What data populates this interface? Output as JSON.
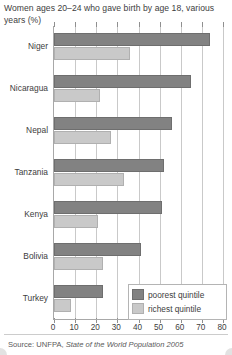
{
  "chart_data": {
    "type": "bar",
    "orientation": "horizontal",
    "title": "Women ages 20–24 who gave birth by age 18, various years (%)",
    "xlabel": "",
    "ylabel": "",
    "xlim": [
      0,
      80
    ],
    "xticks": [
      0,
      10,
      20,
      30,
      40,
      50,
      60,
      70,
      80
    ],
    "grid": true,
    "legend_position": "bottom-right",
    "categories": [
      "Niger",
      "Nicaragua",
      "Nepal",
      "Tanzania",
      "Kenya",
      "Bolivia",
      "Turkey"
    ],
    "series": [
      {
        "name": "poorest quintile",
        "color": "#828282",
        "values": [
          74,
          65,
          56,
          52,
          51,
          41,
          23
        ]
      },
      {
        "name": "richest quintile",
        "color": "#c9c9c9",
        "values": [
          36,
          22,
          27,
          33,
          21,
          23,
          8
        ]
      }
    ],
    "source": "Source: UNFPA, State of the World Population 2005"
  },
  "source": {
    "prefix": "Source: UNFPA, ",
    "italic_part": "State of the World Population 2005"
  }
}
